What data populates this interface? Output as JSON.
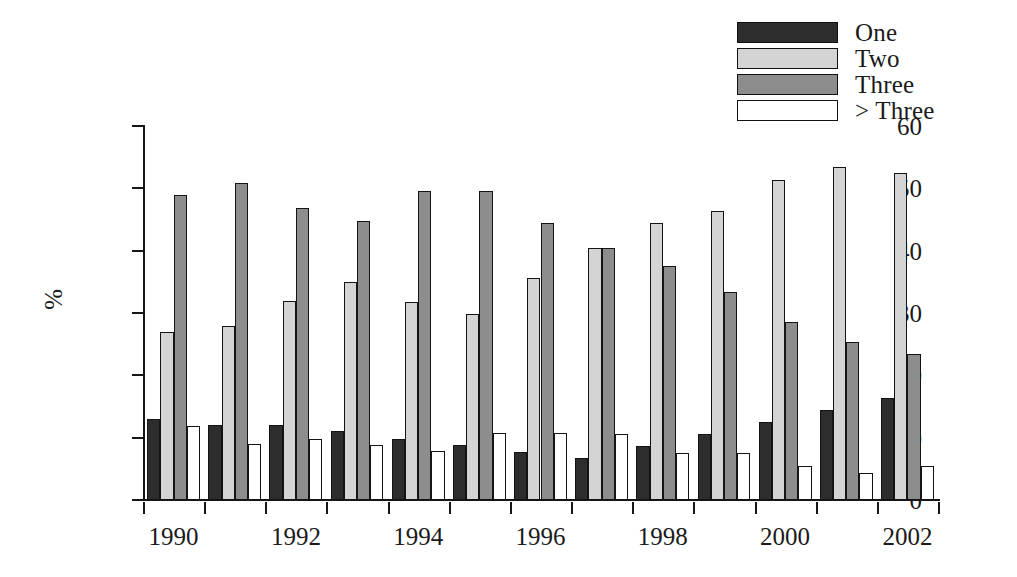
{
  "chart_data": {
    "type": "bar",
    "title": "",
    "subtitle": "",
    "xlabel": "",
    "ylabel": "%",
    "grid": false,
    "legend_position": "top-right",
    "ylim": [
      0,
      60
    ],
    "yticks": [
      0,
      10,
      20,
      30,
      40,
      50,
      60
    ],
    "categories": [
      "1990",
      "1991",
      "1992",
      "1993",
      "1994",
      "1995",
      "1996",
      "1997",
      "1998",
      "1999",
      "2000",
      "2001",
      "2002"
    ],
    "xtick_labels_shown": [
      "1990",
      "",
      "1992",
      "",
      "1994",
      "",
      "1996",
      "",
      "1998",
      "",
      "2000",
      "",
      "2002"
    ],
    "series": [
      {
        "name": "One",
        "color": "#2d2d2d",
        "values": [
          13.0,
          12.0,
          12.0,
          11.0,
          9.8,
          8.8,
          7.7,
          6.7,
          8.6,
          10.6,
          12.5,
          14.4,
          16.4
        ]
      },
      {
        "name": "Two",
        "color": "#d4d4d4",
        "values": [
          26.9,
          27.9,
          31.9,
          34.9,
          31.8,
          29.8,
          35.6,
          40.5,
          44.4,
          46.4,
          51.4,
          53.4,
          52.4
        ]
      },
      {
        "name": "Three",
        "color": "#8d8d8d",
        "values": [
          48.9,
          50.8,
          46.8,
          44.8,
          49.6,
          49.6,
          44.4,
          40.5,
          37.5,
          33.4,
          28.5,
          25.4,
          23.4
        ]
      },
      {
        "name": "> Three",
        "color": "#ffffff",
        "values": [
          11.9,
          9.0,
          9.8,
          8.8,
          7.8,
          10.8,
          10.7,
          10.6,
          7.5,
          7.5,
          5.4,
          4.3,
          5.4
        ]
      }
    ]
  },
  "legend": {
    "items": [
      {
        "label": "One",
        "color": "#2d2d2d"
      },
      {
        "label": "Two",
        "color": "#d4d4d4"
      },
      {
        "label": "Three",
        "color": "#8d8d8d"
      },
      {
        "label": "> Three",
        "color": "#ffffff"
      }
    ]
  },
  "axes": {
    "y_axis_label": "%",
    "y_tick_labels": [
      "60",
      "50",
      "40",
      "30",
      "20",
      "10",
      "0"
    ],
    "x_tick_labels": [
      "1990",
      "1992",
      "1994",
      "1996",
      "1998",
      "2000",
      "2002"
    ]
  }
}
